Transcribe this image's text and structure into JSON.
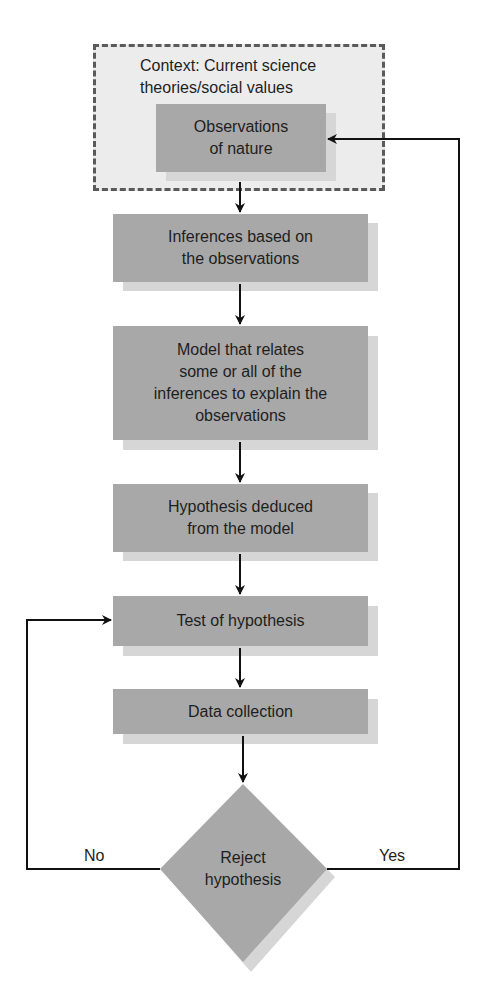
{
  "diagram": {
    "type": "flowchart",
    "context": {
      "label": "Context: Current science theories/social values",
      "line1": "Context: Current science",
      "line2": "theories/social values"
    },
    "nodes": [
      {
        "id": "observations",
        "shape": "rect",
        "text": "Observations of nature",
        "lines": [
          "Observations",
          "of nature"
        ]
      },
      {
        "id": "inferences",
        "shape": "rect",
        "text": "Inferences based on the observations",
        "lines": [
          "Inferences based on",
          "the observations"
        ]
      },
      {
        "id": "model",
        "shape": "rect",
        "text": "Model that relates some or all of the inferences to explain the observations",
        "lines": [
          "Model that relates",
          "some or all of the",
          "inferences to explain the",
          "observations"
        ]
      },
      {
        "id": "hypothesis",
        "shape": "rect",
        "text": "Hypothesis deduced from the model",
        "lines": [
          "Hypothesis deduced",
          "from the model"
        ]
      },
      {
        "id": "test",
        "shape": "rect",
        "text": "Test of hypothesis",
        "lines": [
          "Test of hypothesis"
        ]
      },
      {
        "id": "data",
        "shape": "rect",
        "text": "Data collection",
        "lines": [
          "Data collection"
        ]
      },
      {
        "id": "reject",
        "shape": "diamond",
        "text": "Reject hypothesis",
        "lines": [
          "Reject",
          "hypothesis"
        ]
      }
    ],
    "edges": [
      {
        "from": "observations",
        "to": "inferences"
      },
      {
        "from": "inferences",
        "to": "model"
      },
      {
        "from": "model",
        "to": "hypothesis"
      },
      {
        "from": "hypothesis",
        "to": "test"
      },
      {
        "from": "test",
        "to": "data"
      },
      {
        "from": "data",
        "to": "reject"
      },
      {
        "from": "reject",
        "to": "test",
        "label": "No"
      },
      {
        "from": "reject",
        "to": "observations",
        "label": "Yes"
      }
    ],
    "edge_labels": {
      "no": "No",
      "yes": "Yes"
    },
    "colors": {
      "box_fill": "#a8a8a8",
      "box_shadow": "#d6d6d6",
      "context_fill": "#ececec",
      "context_border": "#5a5a5a",
      "line": "#111111"
    }
  }
}
